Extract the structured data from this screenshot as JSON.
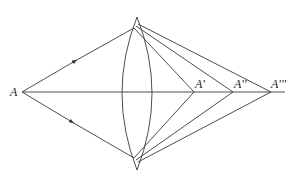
{
  "diagram": {
    "title": "",
    "type": "lens ray diagram",
    "colors": {
      "line": "#3a3a3a",
      "background": "#ffffff",
      "text": "#222222"
    },
    "labels": {
      "object": "A",
      "image1": "A'",
      "image2": "A''",
      "image3": "A'''"
    },
    "nodes": [
      {
        "id": "A",
        "label": "A",
        "x": 22,
        "y": 92
      },
      {
        "id": "A1",
        "label": "A'",
        "x": 194,
        "y": 92
      },
      {
        "id": "A2",
        "label": "A''",
        "x": 233,
        "y": 92
      },
      {
        "id": "A3",
        "label": "A'''",
        "x": 271,
        "y": 92
      },
      {
        "id": "lens",
        "label": "",
        "shape": "biconvex lens",
        "top": [
          137,
          17
        ],
        "bottom": [
          137,
          170
        ]
      }
    ],
    "edges": [
      {
        "from": "A",
        "to": "lens-top",
        "arrow": "mid"
      },
      {
        "from": "A",
        "to": "lens-bottom",
        "arrow": "mid"
      },
      {
        "from": "A",
        "to": "axis-end",
        "arrow": "none"
      },
      {
        "from": "lens-top",
        "to": "A1"
      },
      {
        "from": "lens-top",
        "to": "A2"
      },
      {
        "from": "lens-top",
        "to": "A3"
      },
      {
        "from": "lens-bottom",
        "to": "A1"
      },
      {
        "from": "lens-bottom",
        "to": "A2"
      },
      {
        "from": "lens-bottom",
        "to": "A3"
      }
    ]
  }
}
